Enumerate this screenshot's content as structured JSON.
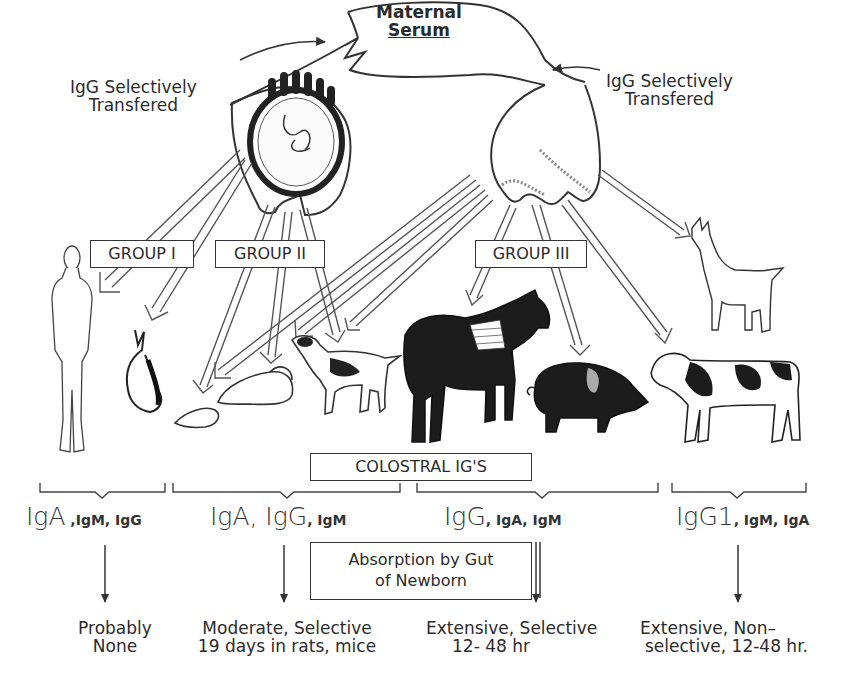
{
  "diagram": {
    "title_node": {
      "line1": "Maternal",
      "line2": "Serum"
    },
    "transfer_labels": [
      {
        "line1": "IgG Selectively",
        "line2": "Transfered"
      },
      {
        "line1": "IgG Selectively",
        "line2": "Transfered"
      }
    ],
    "sources": [
      "placenta-uterus",
      "mammary-gland"
    ],
    "groups": [
      {
        "label": "GROUP I",
        "animals": [
          "human",
          "rabbit"
        ]
      },
      {
        "label": "GROUP II",
        "animals": [
          "rat",
          "mouse",
          "dog"
        ]
      },
      {
        "label": "GROUP III",
        "animals": [
          "horse",
          "pig",
          "cow",
          "goat"
        ]
      }
    ],
    "colostral_label": "COLOSTRAL IG'S",
    "immunoglobulins": [
      {
        "main": "IgA",
        "minor": " ,IgM, IgG"
      },
      {
        "main": "IgA, IgG",
        "minor": ", IgM"
      },
      {
        "main": "IgG",
        "minor": ", IgA, IgM"
      },
      {
        "main": "IgG1",
        "minor": ", IgM, IgA"
      }
    ],
    "absorption_box": {
      "line1": "Absorption by Gut",
      "line2": "of Newborn"
    },
    "outcomes": [
      {
        "line1": "Probably",
        "line2": "None"
      },
      {
        "line1": "Moderate, Selective",
        "line2": "19 days in rats, mice"
      },
      {
        "line1": "Extensive, Selective",
        "line2": "12- 48 hr"
      },
      {
        "line1": "Extensive, Non–",
        "line2": "selective, 12-48 hr."
      }
    ]
  }
}
